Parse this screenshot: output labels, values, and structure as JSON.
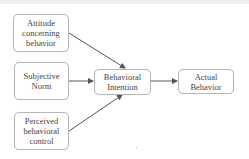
{
  "diagram": {
    "nodes": [
      {
        "id": "attitude",
        "label": "Attitude\nconcerning\nbehavior"
      },
      {
        "id": "norm",
        "label": "Subjective\nNorm"
      },
      {
        "id": "pbc",
        "label": "Perceived\nbehavioral\ncontrol"
      },
      {
        "id": "intention",
        "label": "Behavioral\nIntention"
      },
      {
        "id": "behavior",
        "label": "Actual\nBehavior"
      }
    ],
    "edges": [
      {
        "from": "attitude",
        "to": "intention"
      },
      {
        "from": "norm",
        "to": "intention"
      },
      {
        "from": "pbc",
        "to": "intention"
      },
      {
        "from": "intention",
        "to": "behavior"
      }
    ],
    "colors": {
      "border": "#b5b5b5",
      "arrow": "#555555",
      "text": "#444444"
    }
  }
}
